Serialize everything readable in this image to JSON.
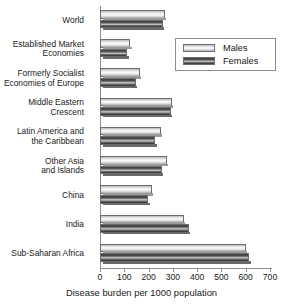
{
  "chart_data": {
    "type": "bar",
    "orientation": "horizontal",
    "title": "",
    "xlabel": "Disease burden per 1000 population",
    "ylabel": "",
    "xlim": [
      0,
      700
    ],
    "xticks": [
      0,
      100,
      200,
      300,
      400,
      500,
      600,
      700
    ],
    "xtick_labels": [
      "0",
      "100",
      "200",
      "300",
      "400",
      "500",
      "600",
      "700"
    ],
    "grid": false,
    "legend_position": "upper right",
    "categories": [
      "World",
      "Established Market\nEconomies",
      "Formerly Socialist\nEconomies of Europe",
      "Middle Eastern\nCrescent",
      "Latin America and\nthe Caribbean",
      "Other Asia\nand Islands",
      "China",
      "India",
      "Sub-Saharan Africa"
    ],
    "series": [
      {
        "name": "Males",
        "color": "#f0f0f0",
        "values": [
          268,
          125,
          165,
          295,
          250,
          275,
          213,
          345,
          600
        ]
      },
      {
        "name": "Females",
        "color": "#555555",
        "values": [
          259,
          113,
          148,
          293,
          228,
          256,
          199,
          365,
          615
        ]
      }
    ]
  },
  "legend": {
    "entries": [
      {
        "label": "Males"
      },
      {
        "label": "Females"
      }
    ]
  }
}
